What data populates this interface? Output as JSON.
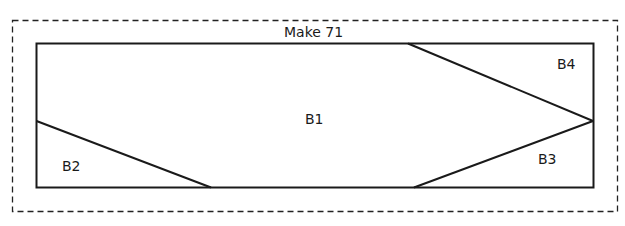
{
  "title": "Make 71",
  "pieces": [
    {
      "id": "B1",
      "label": "B1"
    },
    {
      "id": "B2",
      "label": "B2"
    },
    {
      "id": "B3",
      "label": "B3"
    },
    {
      "id": "B4",
      "label": "B4"
    }
  ],
  "colors": {
    "line": "#1a1a1a",
    "background": "#ffffff"
  }
}
